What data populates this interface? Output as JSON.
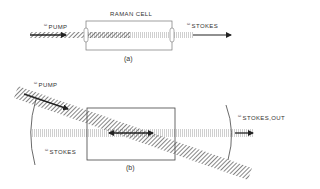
{
  "panel_a": {
    "cell_label": "RAMAN CELL",
    "pump": {
      "symbol": "ω",
      "label": "PUMP"
    },
    "stokes": {
      "symbol": "ω",
      "label": "STOKES"
    },
    "caption": "(a)"
  },
  "panel_b": {
    "pump": {
      "symbol": "ω",
      "label": "PUMP"
    },
    "stokes": {
      "symbol": "ω",
      "label": "STOKES"
    },
    "stokes_out": {
      "symbol": "ω",
      "label": "STOKES,OUT"
    },
    "caption": "(b)"
  },
  "colors": {
    "line": "#555555",
    "arrow": "#222222",
    "hatch": "#444444",
    "stokes_beam": "#d6d6d6"
  }
}
